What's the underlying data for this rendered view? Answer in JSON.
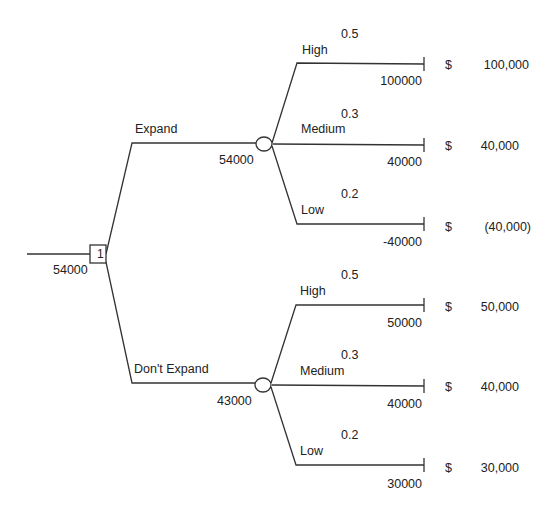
{
  "root": {
    "node_label": "1",
    "value": "54000"
  },
  "decisions": [
    {
      "label": "Expand",
      "chance_value": "54000",
      "outcomes": [
        {
          "label": "High",
          "prob": "0.5",
          "payoff": "100000",
          "currency": "$",
          "display": "100,000"
        },
        {
          "label": "Medium",
          "prob": "0.3",
          "payoff": "40000",
          "currency": "$",
          "display": "40,000"
        },
        {
          "label": "Low",
          "prob": "0.2",
          "payoff": "-40000",
          "currency": "$",
          "display": "(40,000)"
        }
      ]
    },
    {
      "label": "Don't Expand",
      "chance_value": "43000",
      "outcomes": [
        {
          "label": "High",
          "prob": "0.5",
          "payoff": "50000",
          "currency": "$",
          "display": "50,000"
        },
        {
          "label": "Medium",
          "prob": "0.3",
          "payoff": "40000",
          "currency": "$",
          "display": "40,000"
        },
        {
          "label": "Low",
          "prob": "0.2",
          "payoff": "30000",
          "currency": "$",
          "display": "30,000"
        }
      ]
    }
  ]
}
